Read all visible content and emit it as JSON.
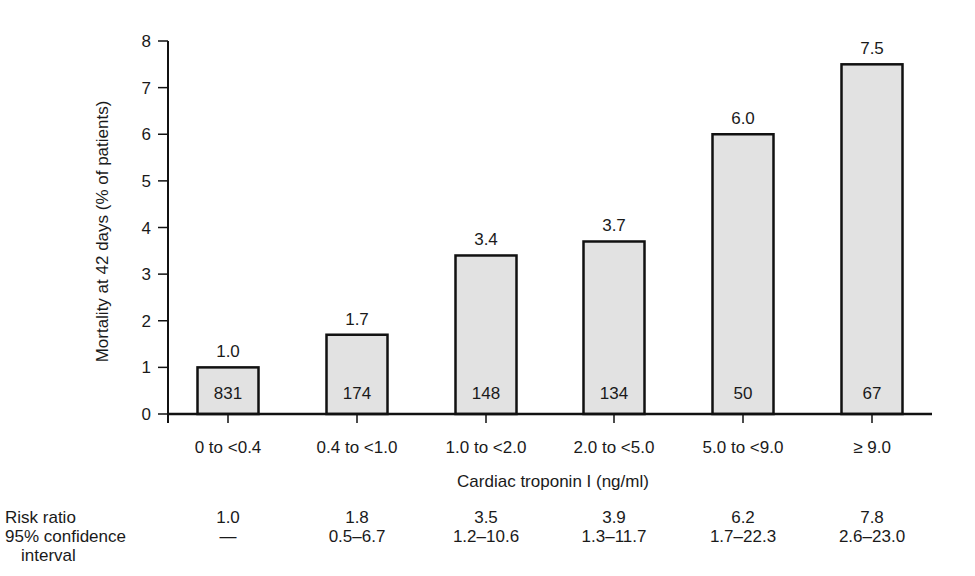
{
  "chart_data": {
    "type": "bar",
    "title": "",
    "xlabel": "Cardiac troponin I (ng/ml)",
    "ylabel": "Mortality at 42 days (% of patients)",
    "ylim": [
      0,
      8
    ],
    "yticks": [
      0,
      1,
      2,
      3,
      4,
      5,
      6,
      7,
      8
    ],
    "grid": false,
    "legend": null,
    "categories": [
      "0 to <0.4",
      "0.4 to <1.0",
      "1.0 to <2.0",
      "2.0 to <5.0",
      "5.0 to <9.0",
      "≥ 9.0"
    ],
    "values": [
      1.0,
      1.7,
      3.4,
      3.7,
      6.0,
      7.5
    ],
    "value_labels": [
      "1.0",
      "1.7",
      "3.4",
      "3.7",
      "6.0",
      "7.5"
    ],
    "patient_counts": [
      831,
      174,
      148,
      134,
      50,
      67
    ],
    "risk_ratio": [
      "1.0",
      "1.8",
      "3.5",
      "3.9",
      "6.2",
      "7.8"
    ],
    "confidence_interval_95": [
      "—",
      "0.5–6.7",
      "1.2–10.6",
      "1.3–11.7",
      "1.7–22.3",
      "2.6–23.0"
    ],
    "bar_color": "#e2e2e2",
    "bar_edge_color": "#111111"
  },
  "table": {
    "risk_ratio_label": "Risk ratio",
    "ci_label_line1": "95% confidence",
    "ci_label_line2": "interval"
  }
}
